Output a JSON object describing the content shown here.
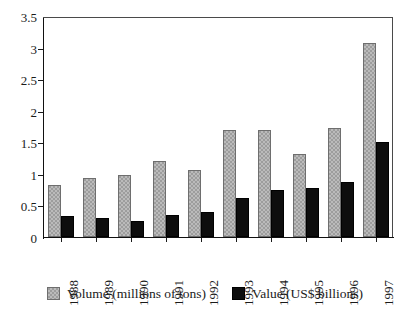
{
  "chart_data": {
    "type": "bar",
    "title": "",
    "xlabel": "",
    "ylabel": "",
    "ylim": [
      0,
      3.5
    ],
    "ytick_labels": [
      "0",
      "0.5",
      "1",
      "1.5",
      "2",
      "2.5",
      "3",
      "3.5"
    ],
    "ytick_values": [
      0,
      0.5,
      1,
      1.5,
      2,
      2.5,
      3,
      3.5
    ],
    "grid": false,
    "legend_position": "bottom",
    "categories": [
      "1988",
      "1989",
      "1990",
      "1991",
      "1992",
      "1993",
      "1994",
      "1995",
      "1996",
      "1997"
    ],
    "series": [
      {
        "name": "Volume (millions of tons)",
        "color": "#9d9d9d",
        "values": [
          0.82,
          0.93,
          0.99,
          1.21,
          1.06,
          1.7,
          1.7,
          1.32,
          1.72,
          3.08
        ]
      },
      {
        "name": "Value (US$ billions)",
        "color": "#0d0d0d",
        "values": [
          0.34,
          0.3,
          0.26,
          0.35,
          0.39,
          0.61,
          0.75,
          0.78,
          0.87,
          1.51
        ]
      }
    ]
  },
  "legend": {
    "entries": [
      {
        "label": "Volume (millions of tons)",
        "swatch": "volume-swatch"
      },
      {
        "label": "Value (US$ billions)",
        "swatch": "value-swatch"
      }
    ]
  }
}
